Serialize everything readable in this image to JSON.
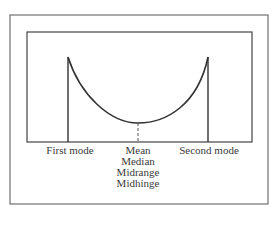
{
  "diagram": {
    "type": "U-shaped bimodal distribution",
    "labels": {
      "first_mode": "First mode",
      "second_mode": "Second mode",
      "center": [
        "Mean",
        "Median",
        "Midrange",
        "Midhinge"
      ]
    },
    "colors": {
      "stroke": "#444444",
      "text": "#3a3a3a"
    }
  }
}
